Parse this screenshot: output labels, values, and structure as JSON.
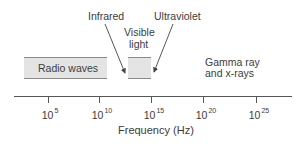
{
  "diagram": {
    "bands": [
      {
        "id": "radio",
        "label": "Radio waves"
      },
      {
        "id": "visible",
        "label_line1": "Visible",
        "label_line2": "light"
      }
    ],
    "callouts": [
      {
        "id": "infrared",
        "label": "Infrared"
      },
      {
        "id": "ultraviolet",
        "label": "Ultraviolet"
      }
    ],
    "gamma": {
      "line1": "Gamma ray",
      "line2": "and x-rays"
    },
    "axis": {
      "label": "Frequency (Hz)",
      "ticks": [
        {
          "base": "10",
          "exp": "5"
        },
        {
          "base": "10",
          "exp": "10"
        },
        {
          "base": "10",
          "exp": "15"
        },
        {
          "base": "10",
          "exp": "20"
        },
        {
          "base": "10",
          "exp": "25"
        }
      ]
    }
  }
}
